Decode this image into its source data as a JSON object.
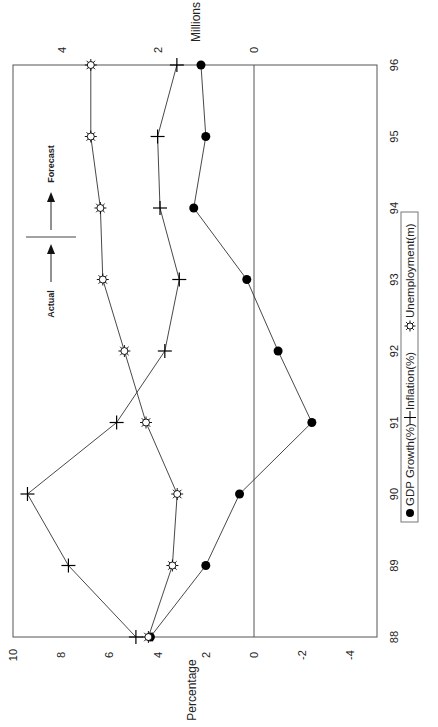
{
  "chart_data": {
    "type": "line",
    "orientation": "rotated-90-counterclockwise",
    "title": "",
    "x": [
      "88",
      "89",
      "90",
      "91",
      "92",
      "93",
      "94",
      "95",
      "96"
    ],
    "xlabel": "",
    "ylabel": "Percentage",
    "ylabel_secondary": "Millions",
    "ylim": [
      -4,
      10
    ],
    "yticks": [
      "10",
      "8",
      "6",
      "4",
      "2",
      "0",
      "-2",
      "-4"
    ],
    "ylim_secondary": [
      0,
      4
    ],
    "yticks_secondary": [
      "4",
      "2",
      "0"
    ],
    "grid": false,
    "zero_line": true,
    "series": [
      {
        "name": "GDP Growth(%)",
        "marker": "filled-circle",
        "axis": "primary",
        "values": [
          4.3,
          2.0,
          0.6,
          -2.4,
          -1.0,
          0.3,
          2.5,
          2.0,
          2.2
        ]
      },
      {
        "name": "Inflation(%)",
        "marker": "plus",
        "axis": "primary",
        "values": [
          4.9,
          7.7,
          9.4,
          5.7,
          3.7,
          3.1,
          3.9,
          4.0,
          3.2
        ]
      },
      {
        "name": "Unemployment(m)",
        "marker": "sun",
        "axis": "secondary",
        "values": [
          2.2,
          1.7,
          1.6,
          2.25,
          2.7,
          3.15,
          3.2,
          3.4,
          3.4
        ]
      }
    ],
    "annotations": [
      {
        "text": "Actual",
        "arrow": "toward earlier years"
      },
      {
        "text": "Forecast",
        "arrow": "toward later years"
      }
    ],
    "legend_position": "bottom"
  },
  "labels": {
    "ylabel": "Percentage",
    "ylabel_secondary": "Millions",
    "actual": "Actual",
    "forecast": "Forecast",
    "legend": [
      "GDP Growth(%)",
      "Inflation(%)",
      "Unemployment(m)"
    ]
  }
}
